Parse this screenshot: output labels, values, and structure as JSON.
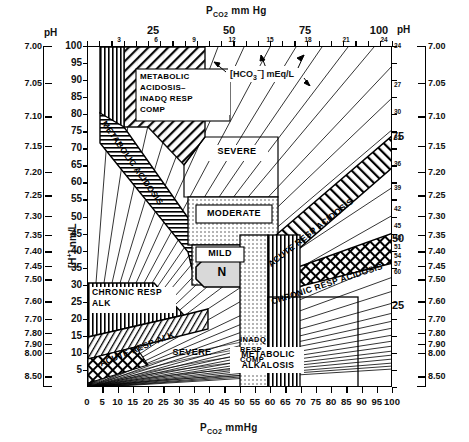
{
  "chart_data": {
    "type": "line",
    "xlabel": "PCO2 mmHg",
    "ylabel": "[H+] nm/L",
    "y2label": "pH",
    "xlim": [
      0,
      100
    ],
    "ylim": [
      0,
      100
    ],
    "grid": false,
    "legend": "none",
    "x_ticks": [
      0,
      5,
      10,
      15,
      20,
      25,
      30,
      35,
      40,
      45,
      50,
      55,
      60,
      65,
      70,
      75,
      80,
      85,
      90,
      95,
      100
    ],
    "y_ticks": [
      5,
      10,
      15,
      20,
      25,
      30,
      35,
      40,
      45,
      50,
      55,
      60,
      65,
      70,
      75,
      80,
      85,
      90,
      95,
      100
    ],
    "ph_ticks": [
      "7.00",
      "7.05",
      "7.10",
      "7.15",
      "7.20",
      "7.25",
      "7.30",
      "7.35",
      "7.40",
      "7.45",
      "7.50",
      "7.60",
      "7.70",
      "7.80",
      "7.90",
      "8.00",
      "8.50"
    ],
    "ph_values": [
      7.0,
      7.05,
      7.1,
      7.15,
      7.2,
      7.25,
      7.3,
      7.35,
      7.4,
      7.45,
      7.5,
      7.6,
      7.7,
      7.8,
      7.9,
      8.0,
      8.5
    ],
    "hco3_isopleths": [
      3,
      6,
      9,
      12,
      15,
      18,
      21,
      24,
      27,
      30,
      33,
      36,
      39,
      42,
      45,
      48,
      51,
      54,
      57,
      60
    ],
    "hco3_unit": "mEq/L",
    "normal_point": {
      "pco2": 40,
      "h": 40,
      "ph": 7.4,
      "label": "N"
    }
  },
  "axes": {
    "top_title": "P",
    "top_title_sub": "CO2",
    "top_title_unit": " mm Hg",
    "bottom_title": "P",
    "bottom_title_sub": "CO2",
    "bottom_title_unit": " mmHg",
    "left_ph_header": "pH",
    "right_ph_header": "pH",
    "left_h_label_bracket": "[H",
    "left_h_label_sup": "+",
    "left_h_label_close": "]",
    "left_h_label_unit": "nm/L",
    "top_major": [
      "25",
      "50",
      "75",
      "100"
    ],
    "top_hco3_small": [
      "3",
      "6",
      "9",
      "12",
      "15",
      "18",
      "21",
      "24"
    ],
    "bottom_labels": [
      "0",
      "5",
      "10",
      "15",
      "20",
      "25",
      "30",
      "35",
      "40",
      "45",
      "50",
      "55",
      "60",
      "65",
      "70",
      "75",
      "80",
      "85",
      "90",
      "95",
      "100"
    ],
    "left_h_labels": [
      "100",
      "95",
      "90",
      "85",
      "80",
      "75",
      "70",
      "65",
      "60",
      "55",
      "50",
      "45",
      "40",
      "35",
      "30",
      "25",
      "20",
      "15",
      "10",
      "5"
    ],
    "ph_labels": [
      "7.00",
      "7.05",
      "7.10",
      "7.15",
      "7.20",
      "7.25",
      "7.30",
      "7.35",
      "7.40",
      "7.45",
      "7.50",
      "7.60",
      "7.70",
      "7.80",
      "7.90",
      "8.00",
      "8.50"
    ],
    "right_hco3_labels": [
      "24",
      "27",
      "30",
      "33",
      "36",
      "39",
      "42",
      "45",
      "48",
      "51",
      "54",
      "57",
      "60"
    ],
    "right_hplus_labels": [
      "100",
      "75",
      "50",
      "25"
    ]
  },
  "annotations": {
    "hco3_legend": "[HCO3] mEq/L",
    "hco3_legend_prefix": "[HCO",
    "hco3_legend_sub": "3",
    "hco3_legend_sup": "−",
    "hco3_legend_suffix": "] mEq/L",
    "metabolic_acidosis_inadq": "METABOLIC\nACIDOSIS–\nINADQ RESP\nCOMP",
    "metabolic_acidosis_inadq_lines": [
      "METABOLIC",
      "ACIDOSIS–",
      "INADQ RESP",
      "COMP"
    ],
    "metabolic_acidosis": "METABOLIC ACIDOSIS",
    "severe_upper": "SEVERE",
    "moderate": "MODERATE",
    "mild": "MILD",
    "normal": "N",
    "acute_resp_acidosis": "ACUTE RESP ACIDOSIS",
    "chronic_resp_acidosis": "CHRONIC RESP ACIDOSIS",
    "chronic_resp_alk_lines": [
      "CHRONIC RESP",
      "ALK"
    ],
    "acute_resp_alk": "ACUTE RESP ALK",
    "severe_lower": "SEVERE",
    "inadq_resp_comp_lines": [
      "INADQ",
      "RESP",
      "COMP"
    ],
    "metabolic_alkalosis_lines": [
      "METABOLIC",
      "ALKALOSIS"
    ]
  },
  "colors": {
    "ink": "#000000",
    "paper": "#ffffff",
    "hatch": "#333333"
  }
}
